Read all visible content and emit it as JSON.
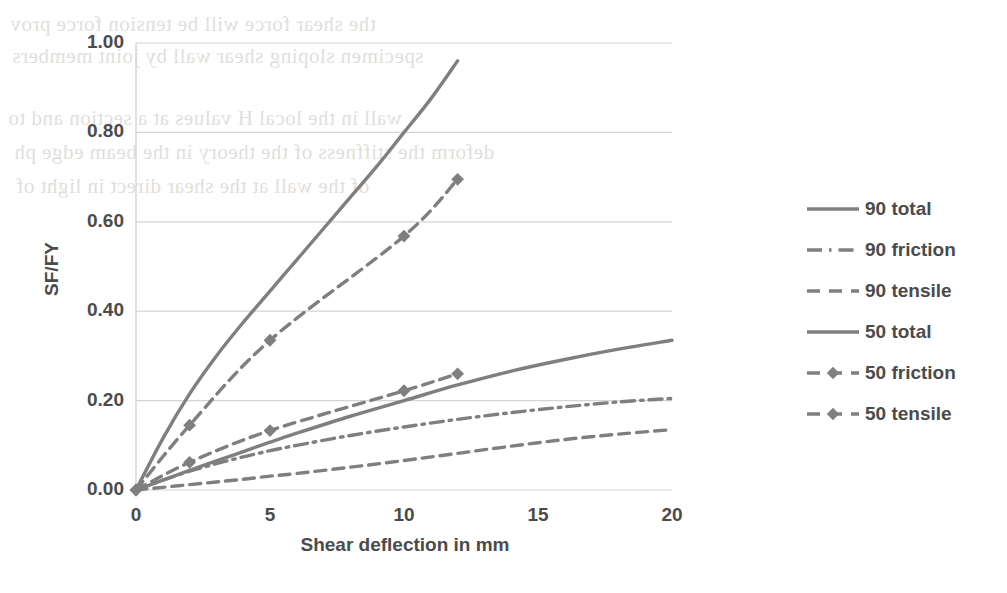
{
  "chart_data": {
    "type": "line",
    "title": "",
    "xlabel": "Shear deflection in mm",
    "ylabel": "SF/FY",
    "xlim": [
      0,
      20
    ],
    "ylim": [
      0,
      1.0
    ],
    "xticks": [
      "0",
      "5",
      "10",
      "15",
      "20"
    ],
    "xtick_values": [
      0,
      5,
      10,
      15,
      20
    ],
    "yticks": [
      "0.00",
      "0.20",
      "0.40",
      "0.60",
      "0.80",
      "1.00"
    ],
    "ytick_values": [
      0,
      0.2,
      0.4,
      0.6,
      0.8,
      1.0
    ],
    "grid": "horizontal",
    "legend_position": "right",
    "line_color": "#7f7f7f",
    "series": [
      {
        "name": "90 total",
        "style": "solid",
        "marker": "none",
        "x": [
          0,
          1,
          2,
          3,
          4,
          5,
          6,
          7,
          8,
          9,
          10,
          11,
          12
        ],
        "values": [
          0.0,
          0.115,
          0.215,
          0.3,
          0.375,
          0.445,
          0.515,
          0.585,
          0.655,
          0.725,
          0.8,
          0.875,
          0.96
        ]
      },
      {
        "name": "90 friction",
        "style": "dash-dot",
        "marker": "none",
        "x": [
          0,
          1,
          2,
          3,
          4,
          5,
          6,
          8,
          10,
          12,
          14,
          16,
          18,
          20
        ],
        "values": [
          0.0,
          0.022,
          0.042,
          0.059,
          0.074,
          0.088,
          0.1,
          0.122,
          0.141,
          0.158,
          0.173,
          0.186,
          0.197,
          0.205
        ]
      },
      {
        "name": "90 tensile",
        "style": "dashed",
        "marker": "none",
        "x": [
          0,
          1,
          2,
          3,
          4,
          5,
          6,
          8,
          10,
          12,
          14,
          16,
          18,
          20
        ],
        "values": [
          0.0,
          0.006,
          0.012,
          0.018,
          0.024,
          0.031,
          0.037,
          0.051,
          0.066,
          0.082,
          0.098,
          0.113,
          0.125,
          0.135
        ]
      },
      {
        "name": "50 total",
        "style": "solid",
        "marker": "none",
        "x": [
          0,
          1,
          2,
          3,
          4,
          5,
          6,
          8,
          10,
          12,
          14,
          16,
          18,
          20
        ],
        "values": [
          0.0,
          0.022,
          0.044,
          0.065,
          0.086,
          0.107,
          0.127,
          0.165,
          0.2,
          0.235,
          0.266,
          0.292,
          0.315,
          0.335
        ]
      },
      {
        "name": "50 friction",
        "style": "dashed",
        "marker": "diamond",
        "x": [
          0,
          2,
          5,
          10,
          12
        ],
        "values": [
          0.0,
          0.062,
          0.133,
          0.222,
          0.26
        ]
      },
      {
        "name": "50 tensile",
        "style": "dashed",
        "marker": "diamond",
        "x": [
          0,
          2,
          5,
          10,
          12
        ],
        "values": [
          0.0,
          0.145,
          0.335,
          0.568,
          0.695
        ]
      }
    ]
  },
  "legend": {
    "items": [
      {
        "label": "90 total",
        "style": "solid",
        "marker": "none"
      },
      {
        "label": "90 friction",
        "style": "dash-dot",
        "marker": "none"
      },
      {
        "label": "90 tensile",
        "style": "dashed",
        "marker": "none"
      },
      {
        "label": "50 total",
        "style": "solid",
        "marker": "none"
      },
      {
        "label": "50 friction",
        "style": "dashed",
        "marker": "diamond"
      },
      {
        "label": "50 tensile",
        "style": "dashed",
        "marker": "diamond"
      }
    ]
  },
  "scan_artifacts": {
    "note": "faint mirrored bleed-through text from reverse of scanned page",
    "lines": [
      "the shear force will be tension force prov",
      "specimen sloping shear wall by joint members",
      "wall in the local H values at a section and to",
      "deform the stiffness of the theory in the beam edge ph",
      "of the wall at the shear direct in light of"
    ]
  }
}
